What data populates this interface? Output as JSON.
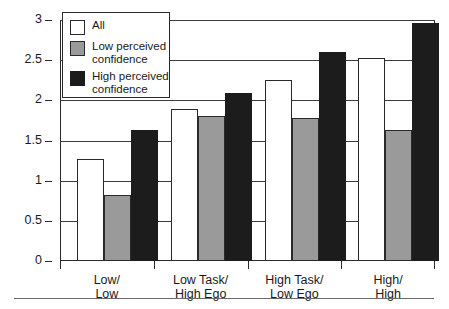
{
  "chart_data": {
    "type": "bar",
    "title": "",
    "xlabel": "",
    "ylabel": "Level of involvement",
    "ylim": [
      0,
      3
    ],
    "ytick_labels": [
      "0",
      "0.5",
      "1",
      "1.5",
      "2",
      "2.5",
      "3"
    ],
    "ytick_values": [
      0,
      0.5,
      1,
      1.5,
      2,
      2.5,
      3
    ],
    "grid": true,
    "legend_position": "upper-left",
    "categories": [
      "Low/\nLow",
      "Low Task/\nHigh Ego",
      "High Task/\nLow Ego",
      "High/\nHigh"
    ],
    "category_lines": [
      [
        "Low/",
        "Low"
      ],
      [
        "Low Task/",
        "High Ego"
      ],
      [
        "High Task/",
        "Low Ego"
      ],
      [
        "High/",
        "High"
      ]
    ],
    "series": [
      {
        "name": "All",
        "color": "#ffffff",
        "values": [
          1.27,
          1.89,
          2.25,
          2.53
        ]
      },
      {
        "name": "Low perceived confidence",
        "color": "#9a9a9a",
        "values": [
          0.82,
          1.81,
          1.78,
          1.63
        ]
      },
      {
        "name": "High perceived confidence",
        "color": "#1c1c1c",
        "values": [
          1.63,
          2.09,
          2.6,
          2.96
        ]
      }
    ]
  },
  "legend": {
    "items": [
      {
        "label": "All",
        "swatch": "all"
      },
      {
        "label": "Low perceived\nconfidence",
        "swatch": "low"
      },
      {
        "label": "High perceived\nconfidence",
        "swatch": "high"
      }
    ]
  },
  "axis": {
    "y_title": "Level of involvement"
  }
}
